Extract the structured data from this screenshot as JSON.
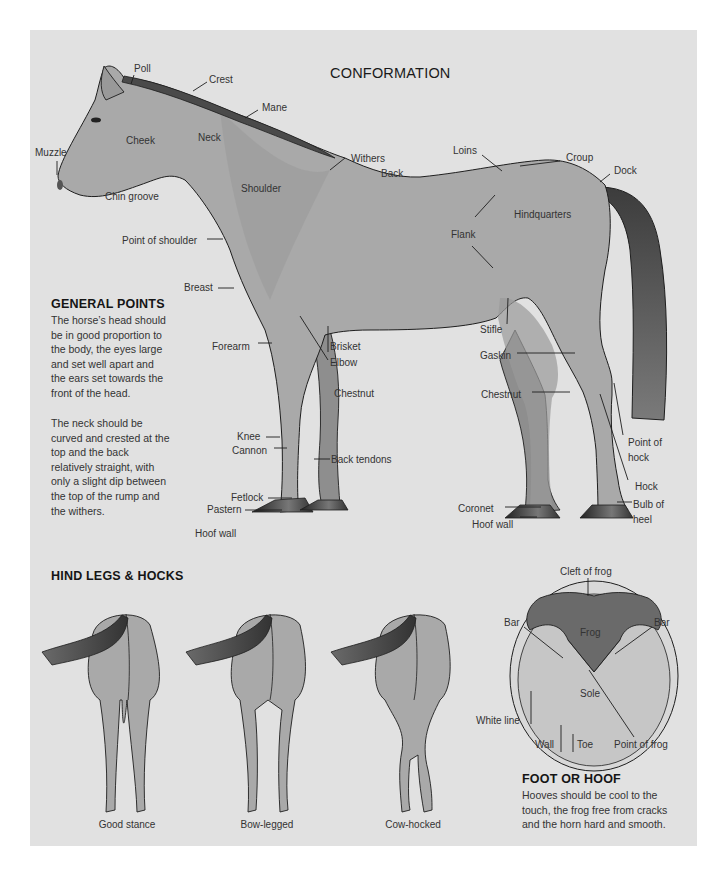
{
  "title": "CONFORMATION",
  "horse_labels": {
    "poll": "Poll",
    "crest": "Crest",
    "mane": "Mane",
    "muzzle": "Muzzle",
    "cheek": "Cheek",
    "neck": "Neck",
    "withers": "Withers",
    "back": "Back",
    "loins": "Loins",
    "croup": "Croup",
    "dock": "Dock",
    "chin_groove": "Chin groove",
    "shoulder": "Shoulder",
    "hindquarters": "Hindquarters",
    "flank": "Flank",
    "point_of_shoulder": "Point of shoulder",
    "breast": "Breast",
    "forearm": "Forearm",
    "brisket": "Brisket",
    "elbow": "Elbow",
    "chestnut_front": "Chestnut",
    "stifle": "Stifle",
    "gaskin": "Gaskin",
    "chestnut_hind": "Chestnut",
    "knee": "Knee",
    "cannon": "Cannon",
    "back_tendons": "Back tendons",
    "fetlock": "Fetlock",
    "pastern": "Pastern",
    "hoof_wall_front": "Hoof wall",
    "point_of_hock_1": "Point of",
    "point_of_hock_2": "hock",
    "hock": "Hock",
    "bulb_of_heel_1": "Bulb of",
    "bulb_of_heel_2": "heel",
    "coronet": "Coronet",
    "hoof_wall_hind": "Hoof wall"
  },
  "general_points": {
    "heading": "GENERAL POINTS",
    "paragraph1": [
      "The horse’s head should",
      "be in good proportion to",
      "the body, the eyes large",
      "and set well apart and",
      "the ears set towards the",
      "front of the head."
    ],
    "paragraph2": [
      "The neck should be",
      "curved and crested at the",
      "top and the back",
      "relatively straight, with",
      "only a slight dip between",
      "the top of the rump and",
      "the withers."
    ]
  },
  "hind_legs": {
    "heading": "HIND LEGS & HOCKS",
    "captions": [
      "Good stance",
      "Bow-legged",
      "Cow-hocked"
    ]
  },
  "hoof_labels": {
    "cleft_of_frog": "Cleft of frog",
    "bar_left": "Bar",
    "bar_right": "Bar",
    "frog": "Frog",
    "sole": "Sole",
    "white_line": "White line",
    "wall": "Wall",
    "toe": "Toe",
    "point_of_frog": "Point of frog"
  },
  "foot_or_hoof": {
    "heading": "FOOT OR HOOF",
    "lines": [
      "Hooves should be cool to the",
      "touch, the frog free from cracks",
      "and the horn hard and smooth."
    ]
  },
  "colors": {
    "panel": "#e1e1e1",
    "horse_body": "#a9a9a9",
    "horse_dark": "#8e8e8e",
    "tail": "#4a4a4a",
    "hoof": "#3a3a3a",
    "outline": "#1e1e1e"
  }
}
